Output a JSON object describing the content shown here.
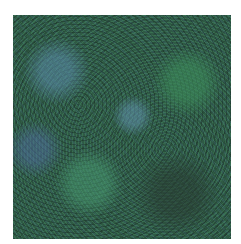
{
  "image": {
    "description": "Speckled green and blue texture square on white background",
    "colors": {
      "base": "#2f5a45",
      "green": "#46966a",
      "blue": "#5a8caa",
      "dark": "#1a2a22",
      "background": "#ffffff"
    }
  }
}
